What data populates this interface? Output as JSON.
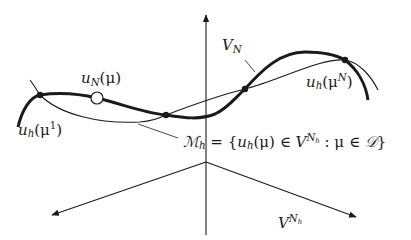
{
  "diagram": {
    "labels": {
      "V_N": {
        "base": "V",
        "sub": "N"
      },
      "u_N_mu": {
        "base": "u",
        "sub": "N",
        "arg": "(μ)"
      },
      "u_h_mu1": {
        "base": "u",
        "sub": "h",
        "open": "(μ",
        "sup": "1",
        "close": ")"
      },
      "u_h_muN": {
        "base": "u",
        "sub": "h",
        "open": "(μ",
        "sup": "N",
        "close": ")"
      },
      "manifold": {
        "lhs_base": "ℳ",
        "lhs_sub": "h",
        "eq": " = {",
        "u": "u",
        "u_sub": "h",
        "mu_arg": "(μ) ∈ ",
        "V": "V",
        "V_sup": "N",
        "V_sup_sub": "h",
        "colon": " : μ ∈ ",
        "D": "𝒟",
        "close": "}"
      },
      "V_Nh": {
        "base": "V",
        "sup": "N",
        "sup_sub": "h"
      }
    },
    "colors": {
      "stroke": "#1a1a1a",
      "background": "#ffffff"
    },
    "points": {
      "snapshots_filled": [
        [
          40,
          95
        ],
        [
          166,
          115
        ],
        [
          245,
          89
        ],
        [
          345,
          60
        ]
      ],
      "rb_solution_open": [
        97,
        98
      ]
    }
  }
}
